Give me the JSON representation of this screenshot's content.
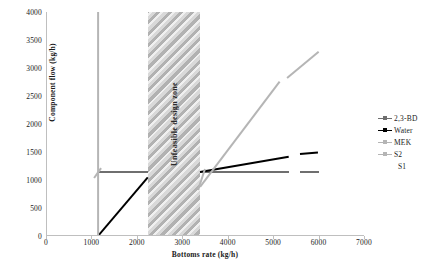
{
  "chart_data": {
    "type": "line",
    "title": "",
    "xlabel": "Bottoms rate (kg/h)",
    "ylabel": "Component flow (kg/h)",
    "xlim": [
      0,
      7000
    ],
    "ylim": [
      0,
      4000
    ],
    "xticks": [
      0,
      1000,
      2000,
      3000,
      4000,
      5000,
      6000,
      7000
    ],
    "yticks": [
      0,
      500,
      1000,
      1500,
      2000,
      2500,
      3000,
      3500,
      4000
    ],
    "grid": false,
    "legend_position": "right",
    "annotations": [
      {
        "name": "unfeasible-design-zone",
        "text": "Unfeasible design zone",
        "x_start": 2250,
        "x_end": 3400,
        "orientation": "vertical-band",
        "rotation_deg": -90
      }
    ],
    "series": [
      {
        "name": "2,3-BD",
        "color": "#6f6f6f",
        "marker": "dash-dot",
        "segments": [
          {
            "x": [
              1150,
              2250
            ],
            "y": [
              1150,
              1150
            ]
          },
          {
            "x": [
              3400,
              5350
            ],
            "y": [
              1150,
              1150
            ]
          },
          {
            "x": [
              5600,
              6000
            ],
            "y": [
              1150,
              1150
            ]
          }
        ]
      },
      {
        "name": "Water",
        "color": "#000000",
        "marker": "dash-dot",
        "segments": [
          {
            "x": [
              1150,
              2250
            ],
            "y": [
              0,
              1050
            ]
          },
          {
            "x": [
              3400,
              5350
            ],
            "y": [
              1150,
              1420
            ]
          },
          {
            "x": [
              5600,
              6000
            ],
            "y": [
              1455,
              1480
            ]
          }
        ]
      },
      {
        "name": "MEK",
        "color": "#b5b5b5",
        "marker": "dash-dot",
        "segments": [
          {
            "x": [
              1150,
              1150
            ],
            "y": [
              0,
              4000
            ]
          },
          {
            "x": [
              1050,
              1200
            ],
            "y": [
              1030,
              1200
            ]
          },
          {
            "x": [
              1150,
              2250
            ],
            "y": [
              0,
              0
            ]
          },
          {
            "x": [
              3350,
              3500
            ],
            "y": [
              830,
              1200
            ]
          },
          {
            "x": [
              3400,
              5150
            ],
            "y": [
              880,
              2760
            ]
          },
          {
            "x": [
              5300,
              6000
            ],
            "y": [
              2830,
              3300
            ]
          }
        ]
      },
      {
        "name": "S2",
        "color": "#b5b5b5",
        "marker": "dash-dot",
        "segments": []
      },
      {
        "name": "S1",
        "color": "#ffffff",
        "marker": "none",
        "segments": []
      }
    ]
  },
  "legend": {
    "items": [
      {
        "label": "2,3-BD",
        "color": "#6f6f6f",
        "has_marker": true
      },
      {
        "label": "Water",
        "color": "#000000",
        "has_marker": true
      },
      {
        "label": "MEK",
        "color": "#b5b5b5",
        "has_marker": true
      },
      {
        "label": "S2",
        "color": "#b5b5b5",
        "has_marker": true
      },
      {
        "label": "S1",
        "color": "#ffffff",
        "has_marker": false
      }
    ]
  }
}
